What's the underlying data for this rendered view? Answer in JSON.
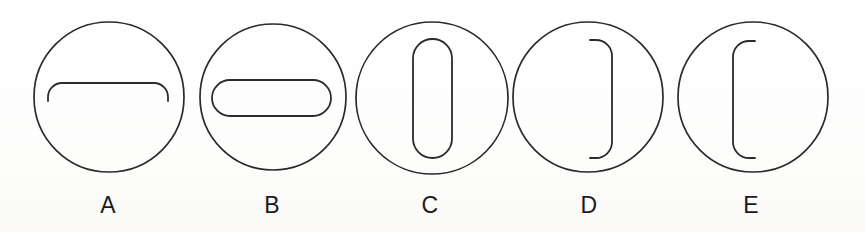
{
  "figure": {
    "background_color": "#ffffff",
    "stroke_color": "#2b2b2b",
    "label_color": "#1a1a1a",
    "caption": "",
    "panel_count": 5
  },
  "panels": [
    {
      "id": "A",
      "label": "A",
      "label_x": 108,
      "label_y": 194,
      "circle": {
        "cx": 109,
        "cy": 97,
        "r": 75
      },
      "inner": {
        "name": "open-arch-downward-ends",
        "description": "horizontal bar with rounded corners whose ends curve downward, open at the bottom",
        "orientation": "horizontal",
        "closed": false,
        "x_left": 48,
        "x_right": 168,
        "y_top": 83,
        "y_end": 101,
        "corner_radius": 14
      }
    },
    {
      "id": "B",
      "label": "B",
      "label_x": 272,
      "label_y": 194,
      "circle": {
        "cx": 273,
        "cy": 97,
        "r": 73
      },
      "inner": {
        "name": "horizontal-stadium",
        "description": "closed horizontal pill / stadium shape",
        "orientation": "horizontal",
        "closed": true,
        "x_left": 212,
        "x_right": 331,
        "y_top": 80,
        "y_bottom": 116,
        "corner_radius": 18
      }
    },
    {
      "id": "C",
      "label": "C",
      "label_x": 430,
      "label_y": 194,
      "circle": {
        "cx": 432,
        "cy": 98,
        "r": 76
      },
      "inner": {
        "name": "vertical-stadium",
        "description": "closed vertical pill / stadium shape",
        "orientation": "vertical",
        "closed": true,
        "x_left": 413,
        "x_right": 452,
        "y_top": 39,
        "y_bottom": 158,
        "corner_radius": 19.5
      }
    },
    {
      "id": "D",
      "label": "D",
      "label_x": 589,
      "label_y": 194,
      "circle": {
        "cx": 588,
        "cy": 97,
        "r": 75
      },
      "inner": {
        "name": "right-bracket-open-left",
        "description": "vertical line with rounded ends curving toward the left, like a closing parenthesis",
        "orientation": "vertical",
        "closed": false,
        "x_spine": 612,
        "x_end": 590,
        "y_top": 40,
        "y_bottom": 158,
        "corner_radius": 16
      }
    },
    {
      "id": "E",
      "label": "E",
      "label_x": 751,
      "label_y": 194,
      "circle": {
        "cx": 753,
        "cy": 97,
        "r": 75
      },
      "inner": {
        "name": "left-bracket-open-right",
        "description": "vertical line with rounded ends curving toward the right, like an opening parenthesis",
        "orientation": "vertical",
        "closed": false,
        "x_spine": 733,
        "x_end": 755,
        "y_top": 41,
        "y_bottom": 158,
        "corner_radius": 16
      }
    }
  ]
}
